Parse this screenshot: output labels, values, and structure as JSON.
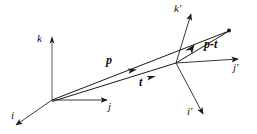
{
  "figure": {
    "background_color": "#ffffff",
    "stroke_color": "#1a1a1a",
    "width": 257,
    "height": 134
  },
  "frames": [
    {
      "name": "frame-unprimed",
      "origin": [
        52,
        100
      ],
      "axes": [
        {
          "label": "i",
          "tip": [
            14,
            127
          ],
          "label_pos": [
            13,
            112
          ]
        },
        {
          "label": "j",
          "tip": [
            110,
            100
          ],
          "label_pos": [
            110,
            103
          ]
        },
        {
          "label": "k",
          "tip": [
            52,
            37
          ],
          "label_pos": [
            39,
            36
          ]
        }
      ]
    },
    {
      "name": "frame-primed",
      "origin": [
        176,
        63
      ],
      "axes": [
        {
          "label": "i'",
          "tip": [
            206,
            119
          ],
          "label_pos": [
            188,
            110
          ]
        },
        {
          "label": "j'",
          "tip": [
            242,
            59
          ],
          "label_pos": [
            234,
            65
          ]
        },
        {
          "label": "k'",
          "tip": [
            193,
            9
          ],
          "label_pos": [
            176,
            6
          ]
        }
      ]
    }
  ],
  "vectors": [
    {
      "label": "p",
      "name": "vector-p",
      "from": [
        52,
        100
      ],
      "to": [
        229,
        31
      ],
      "label_pos": [
        108,
        58
      ],
      "arrow_at": [
        133,
        69
      ]
    },
    {
      "label": "t",
      "name": "vector-t",
      "from": [
        52,
        100
      ],
      "to": [
        176,
        63
      ],
      "label_pos": [
        140,
        79
      ],
      "arrow_at": [
        152,
        76
      ]
    },
    {
      "label": "p-t",
      "name": "vector-p-minus-t",
      "from": [
        176,
        63
      ],
      "to": [
        229,
        31
      ],
      "label_pos": [
        206,
        41
      ],
      "arrow_at": [
        192,
        47
      ]
    }
  ],
  "markers": [
    {
      "name": "endpoint-dot",
      "pos": [
        229,
        31
      ]
    }
  ]
}
